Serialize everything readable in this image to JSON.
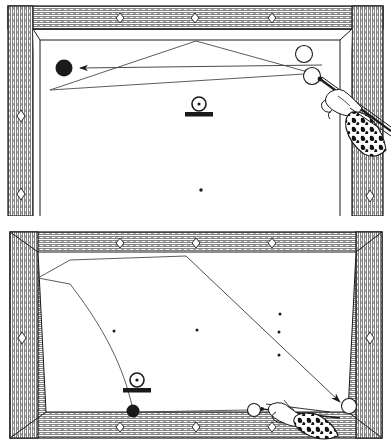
{
  "figure": {
    "background_color": "#ffffff",
    "ink_color": "#1a1a1a",
    "cloth_color": "#ffffff",
    "rail_color": "#4a4a4a",
    "panel_count": 2
  },
  "panels": [
    {
      "id": "top-diagram",
      "name": "Top billiard table diagram (bank shot)",
      "x": 8,
      "y": 6,
      "width": 375,
      "height": 205,
      "cropped_bottom": true,
      "rail": {
        "name": "wooden-rail",
        "diamonds_top": 3,
        "diamonds_left": 2,
        "diamonds_right": 1
      },
      "balls": [
        {
          "name": "object-ball-black",
          "type": "solid-black",
          "cx": 64,
          "cy": 68,
          "r": 8
        },
        {
          "name": "object-ball-white-upper",
          "type": "white",
          "cx": 304,
          "cy": 54,
          "r": 8
        },
        {
          "name": "cue-ball-white",
          "type": "white",
          "cx": 312,
          "cy": 76,
          "r": 8
        }
      ],
      "markers": [
        {
          "name": "spot-marker-center",
          "x": 199,
          "y": 107
        },
        {
          "name": "table-spot-dot",
          "x": 201,
          "y": 190
        }
      ],
      "paths": [
        {
          "name": "aim-arrow-to-black-ball",
          "type": "arrow",
          "from": [
            306,
            70
          ],
          "to": [
            80,
            68
          ]
        },
        {
          "name": "bank-path-upper-leg",
          "type": "line",
          "points": [
            [
              308,
              72
            ],
            [
              196,
              41
            ],
            [
              50,
              90
            ]
          ]
        },
        {
          "name": "bank-path-lower-leg",
          "type": "line",
          "points": [
            [
              50,
              90
            ],
            [
              312,
              77
            ]
          ]
        }
      ],
      "cue": {
        "name": "cue-stick",
        "tip": [
          320,
          80
        ],
        "butt": [
          388,
          130
        ],
        "hand": {
          "name": "bridge-hand",
          "x": 328,
          "y": 86
        },
        "sleeve": {
          "name": "patterned-sleeve",
          "pattern": "animal-print"
        }
      }
    },
    {
      "id": "bottom-diagram",
      "name": "Bottom billiard table diagram (masse / curve shot)",
      "x": 10,
      "y": 232,
      "width": 372,
      "height": 205,
      "cropped_bottom": false,
      "rail": {
        "name": "wooden-rail",
        "diamonds_top": 3,
        "diamonds_bottom": 3,
        "diamonds_left": 1,
        "diamonds_right": 1
      },
      "balls": [
        {
          "name": "object-ball-black",
          "type": "solid-black",
          "cx": 133,
          "cy": 411,
          "r": 6
        },
        {
          "name": "cue-ball-white",
          "type": "white",
          "cx": 254,
          "cy": 410,
          "r": 6
        },
        {
          "name": "target-ball-white",
          "type": "white",
          "cx": 349,
          "cy": 406,
          "r": 7
        }
      ],
      "markers": [
        {
          "name": "spot-marker-center",
          "x": 137,
          "y": 384
        },
        {
          "name": "table-spot-dot-left",
          "x": 114,
          "y": 331
        },
        {
          "name": "table-spot-dot-center",
          "x": 197,
          "y": 330
        },
        {
          "name": "table-spot-dot-right-1",
          "x": 280,
          "y": 314
        },
        {
          "name": "table-spot-dot-right-2",
          "x": 279,
          "y": 332
        },
        {
          "name": "table-spot-dot-right-3",
          "x": 279,
          "y": 355
        }
      ],
      "paths": [
        {
          "name": "curve-path-masse",
          "type": "curve",
          "from": [
            133,
            408
          ],
          "control": [
            110,
            330
          ],
          "to": [
            40,
            277
          ]
        },
        {
          "name": "straight-path-outbound",
          "type": "line",
          "points": [
            [
              68,
              283
            ],
            [
              180,
              256
            ]
          ]
        },
        {
          "name": "straight-path-return-arrow",
          "type": "arrow",
          "points": [
            [
              180,
              256
            ],
            [
              340,
              402
            ]
          ]
        },
        {
          "name": "contact-line-cue-to-object",
          "type": "line",
          "points": [
            [
              248,
              410
            ],
            [
              139,
              412
            ]
          ]
        }
      ],
      "cue": {
        "name": "cue-stick",
        "tip": [
          262,
          409
        ],
        "butt": [
          330,
          424
        ],
        "hand": {
          "name": "bridge-hand",
          "x": 283,
          "y": 412
        },
        "sleeve": {
          "name": "patterned-sleeve",
          "pattern": "animal-print"
        }
      }
    }
  ],
  "legend": {
    "spot_marker_label": "spot marker",
    "black_ball_label": "object ball",
    "white_ball_label": "cue ball"
  }
}
